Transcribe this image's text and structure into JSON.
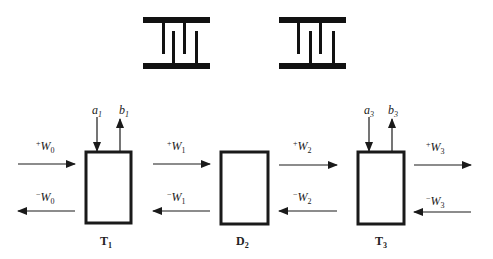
{
  "diagram": {
    "symbols": [
      {
        "name": "interdigital-symbol-left"
      },
      {
        "name": "interdigital-symbol-right"
      }
    ],
    "blocks": [
      {
        "id": "T1",
        "letter": "T",
        "sub": "1",
        "in_label": "a",
        "in_sub": "1",
        "out_label": "b",
        "out_sub": "1"
      },
      {
        "id": "D2",
        "letter": "D",
        "sub": "2"
      },
      {
        "id": "T3",
        "letter": "T",
        "sub": "3",
        "in_label": "a",
        "in_sub": "3",
        "out_label": "b",
        "out_sub": "3"
      }
    ],
    "waves": [
      {
        "fwd_sup": "+",
        "bwd_sup": "−",
        "letter": "W",
        "sub": "0"
      },
      {
        "fwd_sup": "+",
        "bwd_sup": "−",
        "letter": "W",
        "sub": "1"
      },
      {
        "fwd_sup": "+",
        "bwd_sup": "−",
        "letter": "W",
        "sub": "2"
      },
      {
        "fwd_sup": "+",
        "bwd_sup": "−",
        "letter": "W",
        "sub": "3"
      }
    ],
    "colors": {
      "stroke": "#1a1a1a",
      "background": "#ffffff"
    }
  }
}
